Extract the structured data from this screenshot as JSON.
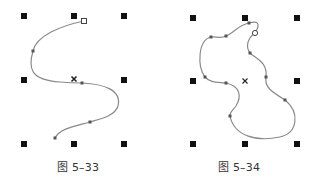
{
  "figures": [
    {
      "caption": "图 5–33",
      "description": "Open S-shaped Bezier curve selected, with 8 bounding-box handles and center marker",
      "handles": [
        [
          24,
          16
        ],
        [
          74,
          16
        ],
        [
          124,
          16
        ],
        [
          24,
          80
        ],
        [
          124,
          80
        ],
        [
          24,
          144
        ],
        [
          74,
          144
        ],
        [
          124,
          144
        ]
      ],
      "center": [
        74,
        79
      ],
      "start_node": [
        84,
        21
      ],
      "nodes": [
        [
          33,
          51
        ],
        [
          82,
          83
        ],
        [
          90,
          122
        ],
        [
          55,
          138
        ]
      ],
      "path": "M84,21 C60,26 36,36 33,51 C28,68 30,80 60,82 C70,83 76,83 82,83 C104,84 122,90 118,106 C115,116 100,119 90,122 C76,126 60,128 55,138"
    },
    {
      "caption": "图 5–34",
      "description": "Closed freeform Bezier curve selected, with 8 bounding-box handles and center marker",
      "handles": [
        [
          193,
          18
        ],
        [
          245,
          18
        ],
        [
          297,
          18
        ],
        [
          193,
          81
        ],
        [
          297,
          81
        ],
        [
          193,
          144
        ],
        [
          245,
          144
        ],
        [
          297,
          144
        ]
      ],
      "center": [
        245,
        81
      ],
      "start_node": [
        255,
        33
      ],
      "nodes": [
        [
          249,
          23
        ],
        [
          226,
          36
        ],
        [
          211,
          37
        ],
        [
          205,
          77
        ],
        [
          226,
          83
        ],
        [
          266,
          77
        ],
        [
          285,
          100
        ],
        [
          230,
          116
        ],
        [
          250,
          53
        ]
      ],
      "path": "M255,33 C262,22 256,21 249,23 C238,25 234,33 226,36 C220,39 216,36 211,37 C198,40 197,66 205,77 C210,83 218,82 226,83 C240,86 242,96 236,106 C232,111 229,113 230,116 C234,136 256,142 280,137 C298,133 300,112 285,100 C272,92 264,87 266,77 C268,62 255,58 250,53 C245,46 248,38 255,33 Z"
    }
  ],
  "colors": {
    "curve": "#8a8a8a",
    "handle": "#111111",
    "node": "#555555",
    "caption": "#333333"
  }
}
